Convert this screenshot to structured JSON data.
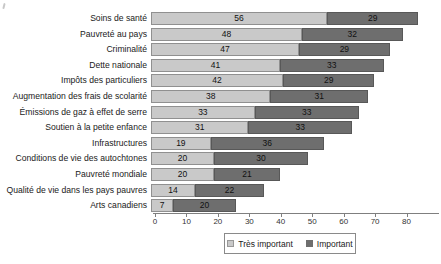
{
  "colors": {
    "tres_important": "#c9c9c9",
    "important": "#6e6e6e",
    "bar_border_light": "#909090",
    "bar_border_dark": "#585858",
    "axis": "#7f7f7f",
    "text": "#1a1a1a"
  },
  "chart_data": {
    "type": "bar",
    "orientation": "horizontal",
    "stacked": true,
    "title": "",
    "xlabel": "",
    "ylabel": "",
    "categories": [
      "Soins de santé",
      "Pauvreté au pays",
      "Criminalité",
      "Dette nationale",
      "Impôts des particuliers",
      "Augmentation des frais de scolarité",
      "Émissions de gaz à effet de serre",
      "Soutien à la petite enfance",
      "Infrastructures",
      "Conditions de vie des autochtones",
      "Pauvreté mondiale",
      "Qualité de vie dans les pays pauvres",
      "Arts canadiens"
    ],
    "series": [
      {
        "name": "Très important",
        "values": [
          56,
          48,
          47,
          41,
          42,
          38,
          33,
          31,
          19,
          20,
          20,
          14,
          7
        ]
      },
      {
        "name": "Important",
        "values": [
          29,
          32,
          29,
          33,
          29,
          31,
          33,
          33,
          36,
          30,
          21,
          22,
          20
        ]
      }
    ],
    "xlim": [
      0,
      90
    ],
    "xticks": [
      0,
      10,
      20,
      30,
      40,
      50,
      60,
      70,
      80
    ],
    "grid": false,
    "legend_position": "bottom-center",
    "value_labels": "inside-center"
  },
  "legend": {
    "items": [
      {
        "label": "Très important"
      },
      {
        "label": "Important"
      }
    ]
  }
}
